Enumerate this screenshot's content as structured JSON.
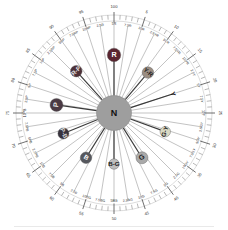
{
  "chart_data": {
    "type": "scatter",
    "center_label": "N",
    "xlabel": "",
    "ylabel": "",
    "grid": true,
    "legend_position": "none",
    "radial_units": "hue step (0-100)",
    "angular_tick_count": 100,
    "major_tick_every": 5,
    "outer_numbers": [
      "5",
      "10",
      "15",
      "20",
      "25",
      "30",
      "35",
      "40",
      "45",
      "50",
      "55",
      "60",
      "65",
      "70",
      "75",
      "80",
      "85",
      "90",
      "95",
      "100"
    ],
    "hue_labels": [
      "5R",
      "7.5R",
      "10R",
      "2.5YR",
      "5YR",
      "7.5YR",
      "10YR",
      "2.5Y",
      "5Y",
      "7.5Y",
      "10Y",
      "2.5GY",
      "5GY",
      "7.5GY",
      "10GY",
      "2.5G",
      "5G",
      "7.5G",
      "10G",
      "2.5BG",
      "5BG",
      "7.5BG",
      "10BG",
      "2.5B",
      "5B",
      "7.5B",
      "10B",
      "2.5PB",
      "5PB",
      "7.5PB",
      "10PB",
      "2.5P",
      "5P",
      "7.5P",
      "10P",
      "2.5RP",
      "5RP",
      "7.5RP",
      "10RP",
      "2.5R"
    ],
    "points": [
      {
        "label": "R",
        "hue": "5R",
        "angle_deg": 0,
        "radius_pct": 66,
        "color": "#5a2530",
        "text_color": "#ffffff",
        "size": 13.5
      },
      {
        "label": "Y-R",
        "hue": "7.5YR",
        "angle_deg": 40,
        "radius_pct": 60,
        "color": "#9a8d82",
        "text_color": "#1a1a1a",
        "size": 11.5
      },
      {
        "label": "Y",
        "hue": "5Y",
        "angle_deg": 72,
        "radius_pct": 70,
        "color": "#2e2e2e",
        "text_color": "#111111",
        "size": 6.0
      },
      {
        "label": "G-Y",
        "hue": "7.5GY",
        "angle_deg": 110,
        "radius_pct": 62,
        "color": "#d9d9c4",
        "text_color": "#1a1a1a",
        "size": 10.5
      },
      {
        "label": "G",
        "hue": "5G",
        "angle_deg": 148,
        "radius_pct": 60,
        "color": "#a9a9a9",
        "text_color": "#1a1a1a",
        "size": 12.0
      },
      {
        "label": "B-G",
        "hue": "5BG",
        "angle_deg": 180,
        "radius_pct": 58,
        "color": "#bdbdbd",
        "text_color": "#1a1a1a",
        "size": 10.5
      },
      {
        "label": "B",
        "hue": "5B",
        "angle_deg": 212,
        "radius_pct": 60,
        "color": "#56585e",
        "text_color": "#ffffff",
        "size": 11.5
      },
      {
        "label": "P-B",
        "hue": "5PB",
        "angle_deg": 248,
        "radius_pct": 62,
        "color": "#38323c",
        "text_color": "#dcdcdc",
        "size": 11.0
      },
      {
        "label": "P",
        "hue": "5P",
        "angle_deg": 278,
        "radius_pct": 66,
        "color": "#4a3a44",
        "text_color": "#e8e8e8",
        "size": 13.0
      },
      {
        "label": "R-P",
        "hue": "5RP",
        "angle_deg": 318,
        "radius_pct": 64,
        "color": "#4e3038",
        "text_color": "#e6e6e6",
        "size": 11.5
      }
    ],
    "center": {
      "label": "N",
      "color": "#9e9e9e",
      "radius_px": 17.5
    },
    "colors": {
      "background": "#ffffff",
      "tick": "#7a7a7a",
      "spoke": "#9a9a9a",
      "spoke_highlight": "#3a3a3a",
      "text": "#2a2a2a"
    }
  },
  "page": {
    "caption": ""
  }
}
